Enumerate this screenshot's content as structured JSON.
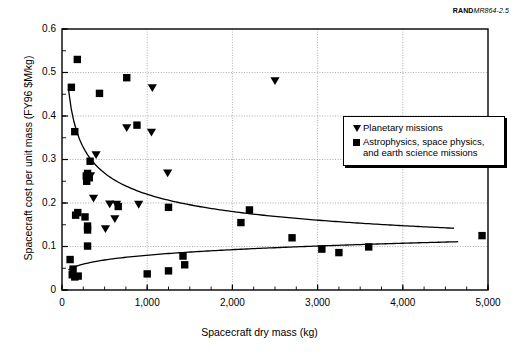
{
  "source_note": {
    "brand": "RAND",
    "number": "MR864-2.5"
  },
  "chart_data": {
    "type": "scatter",
    "title": "",
    "xlabel": "Spacecraft dry mass (kg)",
    "ylabel": "Spacecraft cost per unit mass (FY96 $M/kg)",
    "xlim": [
      0,
      5000
    ],
    "ylim": [
      0,
      0.6
    ],
    "grid": true,
    "legend_position": "upper right",
    "xticks": [
      0,
      1000,
      2000,
      3000,
      4000,
      5000
    ],
    "xtick_labels": [
      "0",
      "1,000",
      "2,000",
      "3,000",
      "4,000",
      "5,000"
    ],
    "yticks": [
      0,
      0.1,
      0.2,
      0.3,
      0.4,
      0.5,
      0.6
    ],
    "ytick_labels": [
      "0",
      "0.1",
      "0.2",
      "0.3",
      "0.4",
      "0.5",
      "0.6"
    ],
    "x_minor_tick_interval": 250,
    "y_minor_tick_interval": 0.05,
    "series": [
      {
        "name": "Planetary missions",
        "marker": "triangle-down",
        "color": "#000000",
        "points": [
          [
            1060,
            0.464
          ],
          [
            2500,
            0.48
          ],
          [
            760,
            0.372
          ],
          [
            1050,
            0.362
          ],
          [
            400,
            0.31
          ],
          [
            1240,
            0.268
          ],
          [
            335,
            0.262
          ],
          [
            300,
            0.255
          ],
          [
            370,
            0.21
          ],
          [
            560,
            0.197
          ],
          [
            640,
            0.196
          ],
          [
            900,
            0.196
          ],
          [
            620,
            0.163
          ],
          [
            510,
            0.14
          ]
        ]
      },
      {
        "name": "Astrophysics, space physics, and earth science missions",
        "marker": "square",
        "color": "#000000",
        "points": [
          [
            180,
            0.53
          ],
          [
            760,
            0.488
          ],
          [
            110,
            0.466
          ],
          [
            440,
            0.452
          ],
          [
            150,
            0.364
          ],
          [
            880,
            0.379
          ],
          [
            330,
            0.296
          ],
          [
            300,
            0.268
          ],
          [
            285,
            0.262
          ],
          [
            320,
            0.258
          ],
          [
            290,
            0.25
          ],
          [
            2200,
            0.184
          ],
          [
            1250,
            0.19
          ],
          [
            660,
            0.192
          ],
          [
            2100,
            0.155
          ],
          [
            270,
            0.168
          ],
          [
            160,
            0.172
          ],
          [
            185,
            0.178
          ],
          [
            300,
            0.147
          ],
          [
            300,
            0.138
          ],
          [
            2700,
            0.12
          ],
          [
            4930,
            0.125
          ],
          [
            300,
            0.101
          ],
          [
            3600,
            0.099
          ],
          [
            3050,
            0.094
          ],
          [
            3250,
            0.086
          ],
          [
            1420,
            0.078
          ],
          [
            95,
            0.07
          ],
          [
            1440,
            0.058
          ],
          [
            130,
            0.048
          ],
          [
            1250,
            0.044
          ],
          [
            1000,
            0.037
          ],
          [
            120,
            0.035
          ],
          [
            190,
            0.032
          ],
          [
            150,
            0.03
          ]
        ]
      }
    ],
    "trend_lines": [
      {
        "name": "planetary-trend",
        "description": "decaying power-law fit through planetary missions",
        "x_range": [
          75,
          4600
        ],
        "y_start": 0.463,
        "y_end": 0.142
      },
      {
        "name": "astrophysics-trend",
        "description": "slowly rising fit through astrophysics, space physics and earth science missions",
        "x_range": [
          75,
          4650
        ],
        "y_start": 0.046,
        "y_end": 0.111
      }
    ]
  }
}
